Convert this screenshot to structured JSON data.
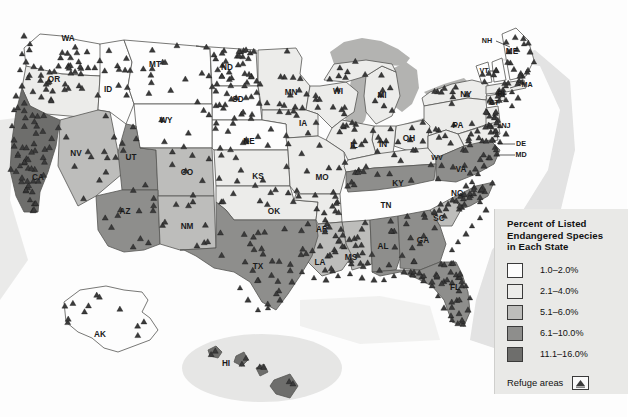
{
  "map": {
    "title_present": false,
    "projection_note": "United States choropleth with Alaska and Hawaii insets",
    "colors": {
      "bin1": "#fdfdfd",
      "bin2": "#ececea",
      "bin3": "#bdbdbb",
      "bin4": "#8e8e8c",
      "bin5": "#6e6e6c",
      "water": "#b3b3b1",
      "border": "#1a1a1a",
      "state_line": "#555553",
      "refuge_marker": "#3b3b3b",
      "background": "#fdfdfd"
    },
    "states": [
      {
        "code": "WA",
        "bin": 1,
        "label_x": 68,
        "label_y": 39
      },
      {
        "code": "OR",
        "bin": 2,
        "label_x": 54,
        "label_y": 80
      },
      {
        "code": "ID",
        "bin": 1,
        "label_x": 108,
        "label_y": 90
      },
      {
        "code": "MT",
        "bin": 1,
        "label_x": 155,
        "label_y": 65
      },
      {
        "code": "ND",
        "bin": 1,
        "label_x": 227,
        "label_y": 68
      },
      {
        "code": "SD",
        "bin": 1,
        "label_x": 238,
        "label_y": 100
      },
      {
        "code": "MN",
        "bin": 2,
        "label_x": 291,
        "label_y": 93
      },
      {
        "code": "WI",
        "bin": 2,
        "label_x": 338,
        "label_y": 92
      },
      {
        "code": "MI",
        "bin": 2,
        "label_x": 382,
        "label_y": 96
      },
      {
        "code": "NY",
        "bin": 2,
        "label_x": 466,
        "label_y": 95
      },
      {
        "code": "NH",
        "bin": 1,
        "label_x": 487,
        "label_y": 41
      },
      {
        "code": "VT",
        "bin": 1,
        "label_x": 484,
        "label_y": 71
      },
      {
        "code": "ME",
        "bin": 1,
        "label_x": 512,
        "label_y": 52
      },
      {
        "code": "MA",
        "bin": 2,
        "label_x": 527,
        "label_y": 85
      },
      {
        "code": "RI",
        "bin": 2,
        "label_x": 501,
        "label_y": 94
      },
      {
        "code": "CT",
        "bin": 2,
        "label_x": 494,
        "label_y": 103
      },
      {
        "code": "PA",
        "bin": 2,
        "label_x": 458,
        "label_y": 126
      },
      {
        "code": "NJ",
        "bin": 2,
        "label_x": 506,
        "label_y": 126
      },
      {
        "code": "DE",
        "bin": 2,
        "label_x": 521,
        "label_y": 144
      },
      {
        "code": "MD",
        "bin": 2,
        "label_x": 521,
        "label_y": 155
      },
      {
        "code": "OH",
        "bin": 2,
        "label_x": 409,
        "label_y": 139
      },
      {
        "code": "IN",
        "bin": 2,
        "label_x": 383,
        "label_y": 145
      },
      {
        "code": "IL",
        "bin": 2,
        "label_x": 354,
        "label_y": 146
      },
      {
        "code": "IA",
        "bin": 2,
        "label_x": 303,
        "label_y": 124
      },
      {
        "code": "NE",
        "bin": 1,
        "label_x": 249,
        "label_y": 142
      },
      {
        "code": "WY",
        "bin": 1,
        "label_x": 166,
        "label_y": 121
      },
      {
        "code": "NV",
        "bin": 3,
        "label_x": 76,
        "label_y": 154
      },
      {
        "code": "UT",
        "bin": 4,
        "label_x": 131,
        "label_y": 158
      },
      {
        "code": "CA",
        "bin": 5,
        "label_x": 38,
        "label_y": 178
      },
      {
        "code": "CO",
        "bin": 3,
        "label_x": 187,
        "label_y": 173
      },
      {
        "code": "KS",
        "bin": 2,
        "label_x": 258,
        "label_y": 177
      },
      {
        "code": "MO",
        "bin": 2,
        "label_x": 322,
        "label_y": 178
      },
      {
        "code": "KY",
        "bin": 2,
        "label_x": 398,
        "label_y": 184
      },
      {
        "code": "WV",
        "bin": 2,
        "label_x": 437,
        "label_y": 158
      },
      {
        "code": "VA",
        "bin": 4,
        "label_x": 461,
        "label_y": 170
      },
      {
        "code": "NC",
        "bin": 4,
        "label_x": 457,
        "label_y": 194
      },
      {
        "code": "TN",
        "bin": 4,
        "label_x": 386,
        "label_y": 206
      },
      {
        "code": "SC",
        "bin": 3,
        "label_x": 439,
        "label_y": 219
      },
      {
        "code": "AZ",
        "bin": 4,
        "label_x": 125,
        "label_y": 212
      },
      {
        "code": "NM",
        "bin": 3,
        "label_x": 187,
        "label_y": 227
      },
      {
        "code": "OK",
        "bin": 2,
        "label_x": 274,
        "label_y": 212
      },
      {
        "code": "AR",
        "bin": 2,
        "label_x": 322,
        "label_y": 230
      },
      {
        "code": "MS",
        "bin": 3,
        "label_x": 351,
        "label_y": 258
      },
      {
        "code": "AL",
        "bin": 4,
        "label_x": 383,
        "label_y": 247
      },
      {
        "code": "GA",
        "bin": 4,
        "label_x": 423,
        "label_y": 241
      },
      {
        "code": "LA",
        "bin": 3,
        "label_x": 320,
        "label_y": 263
      },
      {
        "code": "FL",
        "bin": 4,
        "label_x": 455,
        "label_y": 288
      },
      {
        "code": "TX",
        "bin": 4,
        "label_x": 258,
        "label_y": 267
      },
      {
        "code": "AK",
        "bin": 1,
        "label_x": 100,
        "label_y": 335
      },
      {
        "code": "HI",
        "bin": 5,
        "label_x": 226,
        "label_y": 364
      }
    ]
  },
  "legend": {
    "title_line1": "Percent of Listed",
    "title_line2": "Endangered Species",
    "title_line3": "in Each State",
    "entries": [
      {
        "label": "1.0–2.0%",
        "color": "#fdfdfd"
      },
      {
        "label": "2.1–4.0%",
        "color": "#ececea"
      },
      {
        "label": "5.1–6.0%",
        "color": "#bdbdbb"
      },
      {
        "label": "6.1–10.0%",
        "color": "#8e8e8c"
      },
      {
        "label": "11.1–16.0%",
        "color": "#6e6e6c"
      }
    ],
    "refuge_label": "Refuge areas"
  }
}
